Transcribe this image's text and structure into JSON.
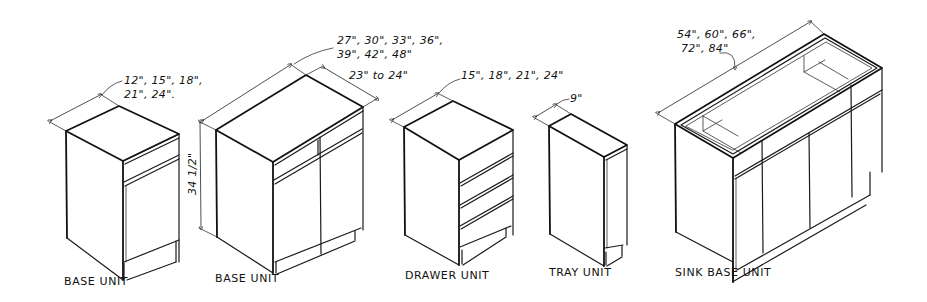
{
  "diagram": {
    "type": "isometric cabinet sketch",
    "units": [
      {
        "id": "base-unit-single",
        "caption": "BASE UNIT",
        "width_label_line1": "12\", 15\", 18\",",
        "width_label_line2": "21\", 24\"."
      },
      {
        "id": "base-unit-double",
        "caption": "BASE UNIT",
        "width_label_line1": "27\", 30\", 33\", 36\",",
        "width_label_line2": "39\", 42\", 48\"",
        "depth_label": "23\" to 24\"",
        "height_label": "34 1/2\""
      },
      {
        "id": "drawer-unit",
        "caption": "DRAWER UNIT",
        "width_label": "15\", 18\", 21\", 24\""
      },
      {
        "id": "tray-unit",
        "caption": "TRAY UNIT",
        "width_label": "9\""
      },
      {
        "id": "sink-base-unit",
        "caption": "SINK BASE UNIT",
        "width_label_line1": "54\", 60\", 66\",",
        "width_label_line2": "72\", 84\""
      }
    ]
  }
}
